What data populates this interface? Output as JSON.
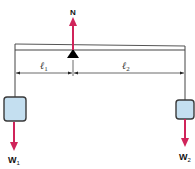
{
  "diagram": {
    "type": "lever-balance",
    "labels": {
      "normal_force": "N",
      "arm1": "ℓ",
      "arm1_sub": "1",
      "arm2": "ℓ",
      "arm2_sub": "2",
      "weight1": "W",
      "weight1_sub": "1",
      "weight2": "W",
      "weight2_sub": "2"
    },
    "colors": {
      "force_arrow": "#d0245a",
      "weight_box_fill": "#c4dff0",
      "weight_box_stroke": "#3a3a3a",
      "beam_stroke": "#444444",
      "fulcrum": "#000000"
    }
  }
}
